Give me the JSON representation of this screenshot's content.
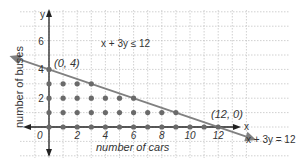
{
  "chart_data": {
    "type": "scatter",
    "title": "",
    "xlabel": "number of cars",
    "ylabel": "number of buses",
    "x_axis_symbol": "x",
    "y_axis_symbol": "y",
    "x_ticks": [
      0,
      2,
      4,
      6,
      8,
      10,
      12
    ],
    "x_tick_labels": [
      "0",
      "2",
      "4",
      "6",
      "8",
      "10",
      "12"
    ],
    "y_ticks": [
      2,
      4,
      6
    ],
    "y_tick_labels": [
      "2",
      "4",
      "6"
    ],
    "xlim": [
      -1,
      14
    ],
    "ylim": [
      -1,
      7
    ],
    "grid": true,
    "inequality_label": "x + 3y ≤ 12",
    "line": {
      "equation_label": "x + 3y = 12",
      "points": [
        [
          0,
          4
        ],
        [
          12,
          0
        ]
      ],
      "color": "#808080"
    },
    "annotations": [
      {
        "text": "(0, 4)",
        "x": 0,
        "y": 4
      },
      {
        "text": "(12, 0)",
        "x": 12,
        "y": 0
      }
    ],
    "series": [
      {
        "name": "feasible integer solutions",
        "color": "#6a6a6a",
        "points": [
          [
            0,
            0
          ],
          [
            1,
            0
          ],
          [
            2,
            0
          ],
          [
            3,
            0
          ],
          [
            4,
            0
          ],
          [
            5,
            0
          ],
          [
            6,
            0
          ],
          [
            7,
            0
          ],
          [
            8,
            0
          ],
          [
            9,
            0
          ],
          [
            10,
            0
          ],
          [
            11,
            0
          ],
          [
            12,
            0
          ],
          [
            0,
            1
          ],
          [
            1,
            1
          ],
          [
            2,
            1
          ],
          [
            3,
            1
          ],
          [
            4,
            1
          ],
          [
            5,
            1
          ],
          [
            6,
            1
          ],
          [
            7,
            1
          ],
          [
            8,
            1
          ],
          [
            9,
            1
          ],
          [
            0,
            2
          ],
          [
            1,
            2
          ],
          [
            2,
            2
          ],
          [
            3,
            2
          ],
          [
            4,
            2
          ],
          [
            5,
            2
          ],
          [
            6,
            2
          ],
          [
            0,
            3
          ],
          [
            1,
            3
          ],
          [
            2,
            3
          ],
          [
            3,
            3
          ],
          [
            0,
            4
          ]
        ]
      }
    ]
  },
  "labels": {
    "y_symbol": "y",
    "x_symbol": "x",
    "xlabel": "number of cars",
    "ylabel": "number of buses",
    "inequality": "x + 3y ≤ 12",
    "equation": "x + 3y = 12",
    "pt_a": "(0, 4)",
    "pt_b": "(12, 0)",
    "origin": "0"
  }
}
